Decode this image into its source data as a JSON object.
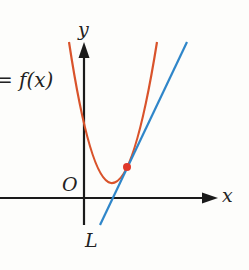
{
  "diagram": {
    "type": "function-graph-with-tangent-line",
    "labels": {
      "y_axis": "y",
      "x_axis": "x",
      "origin": "O",
      "function": "= f(x)",
      "line": "L"
    },
    "colors": {
      "curve": "#d9532b",
      "line": "#2f86c9",
      "axes": "#1a1a1a",
      "point": "#e0392b",
      "background": "#fdfdfb"
    },
    "elements": [
      {
        "name": "curve y = f(x)",
        "shape": "parabola opening upward, vertex in first quadrant, y-intercept positive"
      },
      {
        "name": "line L",
        "shape": "straight line with positive slope, tangent to curve at marked point"
      },
      {
        "name": "tangent point",
        "shape": "red dot where L touches the curve"
      }
    ]
  }
}
